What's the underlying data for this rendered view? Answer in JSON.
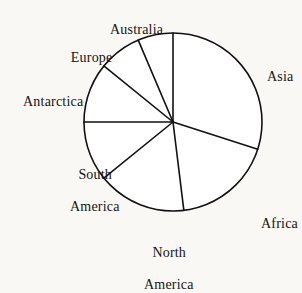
{
  "figure": {
    "background_color": "#faf8f4",
    "stroke_color": "#111111",
    "fill_color": "#ffffff",
    "text_color": "#141414"
  },
  "chart_data": {
    "type": "pie",
    "title": "",
    "subtitle": "",
    "xlabel": "",
    "ylabel": "",
    "grid": false,
    "legend_position": "none",
    "labels_position": "outside",
    "center": {
      "x": 173,
      "y": 122
    },
    "radius": 89,
    "start_angle_deg": 90,
    "direction": "clockwise",
    "categories": [
      "Asia",
      "Africa",
      "North America",
      "South America",
      "Antarctica",
      "Europe",
      "Australia"
    ],
    "values": [
      29.9,
      18.1,
      16.1,
      10.8,
      10.8,
      7.8,
      6.5
    ],
    "angles_deg": [
      107.8,
      65.2,
      58.0,
      39.0,
      39.0,
      28.0,
      23.0
    ],
    "slices": [
      {
        "label": "Asia",
        "value": 29.9,
        "angle_deg": 107.8,
        "start_deg": 90.0,
        "end_deg": -17.8,
        "label_x": 253,
        "label_y": 53,
        "label_anchor": "start"
      },
      {
        "label": "Africa",
        "value": 18.1,
        "angle_deg": 65.2,
        "start_deg": -17.8,
        "end_deg": -83.0,
        "label_x": 247,
        "label_y": 200,
        "label_anchor": "start"
      },
      {
        "label": "North\nAmerica",
        "value": 16.1,
        "angle_deg": 58.0,
        "start_deg": -83.0,
        "end_deg": -141.0,
        "label_x": 130,
        "label_y": 229,
        "label_anchor": "middle"
      },
      {
        "label": "South\nAmerica",
        "value": 10.8,
        "angle_deg": 39.0,
        "start_deg": -141.0,
        "end_deg": 180.0,
        "label_x": 56,
        "label_y": 151,
        "label_anchor": "middle"
      },
      {
        "label": "Antarctica",
        "value": 10.8,
        "angle_deg": 39.0,
        "start_deg": 180.0,
        "end_deg": 141.0,
        "label_x": 9,
        "label_y": 78,
        "label_anchor": "start"
      },
      {
        "label": "Europe",
        "value": 7.8,
        "angle_deg": 28.0,
        "start_deg": 141.0,
        "end_deg": 113.0,
        "label_x": 56,
        "label_y": 34,
        "label_anchor": "start"
      },
      {
        "label": "Australia",
        "value": 6.5,
        "angle_deg": 23.0,
        "start_deg": 113.0,
        "end_deg": 90.0,
        "label_x": 96,
        "label_y": 6,
        "label_anchor": "start"
      }
    ]
  },
  "labels": {
    "asia": "Asia",
    "africa": "Africa",
    "north_america_line1": "North",
    "north_america_line2": "America",
    "south_america_line1": "South",
    "south_america_line2": "America",
    "antarctica": "Antarctica",
    "europe": "Europe",
    "australia": "Australia"
  }
}
